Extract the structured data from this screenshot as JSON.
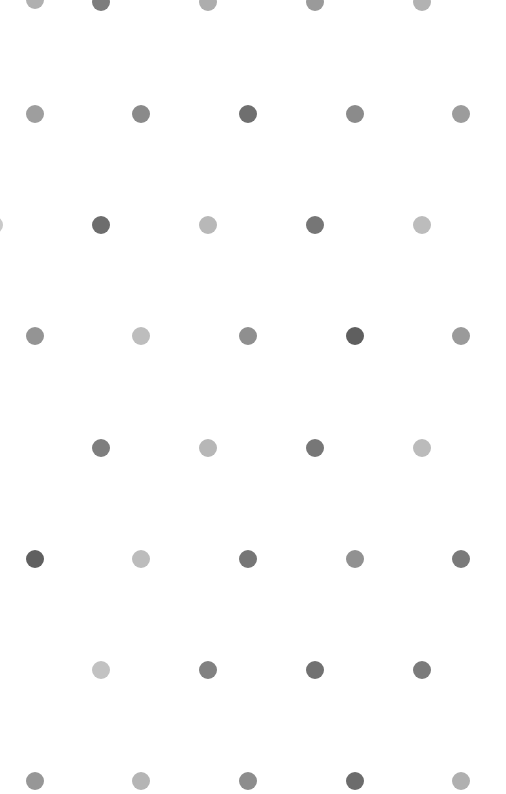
{
  "canvas": {
    "width": 506,
    "height": 794,
    "background_color": "#ffffff",
    "title": "Polka Dot Pattern"
  },
  "pattern": {
    "type": "staggered-dot-grid",
    "dot_diameter": 18,
    "row_spacing": 111,
    "column_spacing": 107,
    "row_count": 8,
    "main_row_x_positions": [
      35,
      141,
      248,
      355,
      461
    ],
    "offset_row_x_positions": [
      -6,
      101,
      208,
      315,
      422
    ],
    "palette": [
      "#7c7c7c",
      "#8e8e8e",
      "#a0a0a0",
      "#b4b4b4",
      "#c4c4c4",
      "#6a6a6a",
      "#5e5e5e",
      "#9a9a9a"
    ]
  },
  "dots": [
    {
      "cx": 35,
      "cy": 0,
      "r": 9,
      "color": "#b0b0b0"
    },
    {
      "cx": 101,
      "cy": 2,
      "r": 9,
      "color": "#7d7d7d"
    },
    {
      "cx": 208,
      "cy": 2,
      "r": 9,
      "color": "#adadad"
    },
    {
      "cx": 315,
      "cy": 2,
      "r": 9,
      "color": "#9a9a9a"
    },
    {
      "cx": 422,
      "cy": 2,
      "r": 9,
      "color": "#b2b2b2"
    },
    {
      "cx": 35,
      "cy": 114,
      "r": 9,
      "color": "#9e9e9e"
    },
    {
      "cx": 141,
      "cy": 114,
      "r": 9,
      "color": "#8a8a8a"
    },
    {
      "cx": 248,
      "cy": 114,
      "r": 9,
      "color": "#6f6f6f"
    },
    {
      "cx": 355,
      "cy": 114,
      "r": 9,
      "color": "#8b8b8b"
    },
    {
      "cx": 461,
      "cy": 114,
      "r": 9,
      "color": "#9c9c9c"
    },
    {
      "cx": -6,
      "cy": 225,
      "r": 9,
      "color": "#c9c9c9"
    },
    {
      "cx": 101,
      "cy": 225,
      "r": 9,
      "color": "#6d6d6d"
    },
    {
      "cx": 208,
      "cy": 225,
      "r": 9,
      "color": "#b8b8b8"
    },
    {
      "cx": 315,
      "cy": 225,
      "r": 9,
      "color": "#767676"
    },
    {
      "cx": 422,
      "cy": 225,
      "r": 9,
      "color": "#bcbcbc"
    },
    {
      "cx": 35,
      "cy": 336,
      "r": 9,
      "color": "#949494"
    },
    {
      "cx": 141,
      "cy": 336,
      "r": 9,
      "color": "#bdbdbd"
    },
    {
      "cx": 248,
      "cy": 336,
      "r": 9,
      "color": "#8f8f8f"
    },
    {
      "cx": 355,
      "cy": 336,
      "r": 9,
      "color": "#5f5f5f"
    },
    {
      "cx": 461,
      "cy": 336,
      "r": 9,
      "color": "#9a9a9a"
    },
    {
      "cx": 101,
      "cy": 448,
      "r": 9,
      "color": "#7e7e7e"
    },
    {
      "cx": 208,
      "cy": 448,
      "r": 9,
      "color": "#b7b7b7"
    },
    {
      "cx": 315,
      "cy": 448,
      "r": 9,
      "color": "#777777"
    },
    {
      "cx": 422,
      "cy": 448,
      "r": 9,
      "color": "#bbbbbb"
    },
    {
      "cx": 35,
      "cy": 559,
      "r": 9,
      "color": "#606060"
    },
    {
      "cx": 141,
      "cy": 559,
      "r": 9,
      "color": "#bcbcbc"
    },
    {
      "cx": 248,
      "cy": 559,
      "r": 9,
      "color": "#767676"
    },
    {
      "cx": 355,
      "cy": 559,
      "r": 9,
      "color": "#919191"
    },
    {
      "cx": 461,
      "cy": 559,
      "r": 9,
      "color": "#7a7a7a"
    },
    {
      "cx": 101,
      "cy": 670,
      "r": 9,
      "color": "#c2c2c2"
    },
    {
      "cx": 208,
      "cy": 670,
      "r": 9,
      "color": "#818181"
    },
    {
      "cx": 315,
      "cy": 670,
      "r": 9,
      "color": "#717171"
    },
    {
      "cx": 422,
      "cy": 670,
      "r": 9,
      "color": "#7b7b7b"
    },
    {
      "cx": 35,
      "cy": 781,
      "r": 9,
      "color": "#979797"
    },
    {
      "cx": 141,
      "cy": 781,
      "r": 9,
      "color": "#b5b5b5"
    },
    {
      "cx": 248,
      "cy": 781,
      "r": 9,
      "color": "#8d8d8d"
    },
    {
      "cx": 355,
      "cy": 781,
      "r": 9,
      "color": "#6c6c6c"
    },
    {
      "cx": 461,
      "cy": 781,
      "r": 9,
      "color": "#b0b0b0"
    }
  ]
}
